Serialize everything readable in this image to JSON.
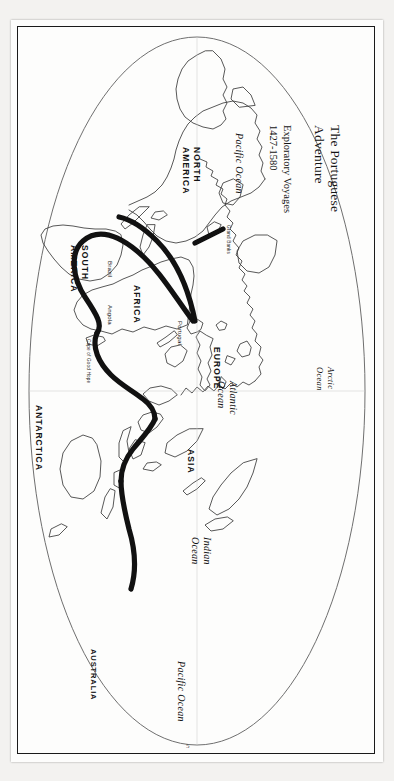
{
  "document": {
    "title_line1": "The Portuguese",
    "title_line2": "Adventure",
    "subtitle_line1": "Exploratory Voyages",
    "subtitle_line2": "1427-1580",
    "page_mark": "5",
    "frame_color": "#1a1a1a",
    "route_color": "#111111",
    "coastline_color": "#3a3a3a",
    "paper_color": "#fdfdfc"
  },
  "map": {
    "projection_note": "oval world map, rotated 90 degrees on the page",
    "continents": [
      {
        "id": "north-america",
        "label": "NORTH\nAMERICA"
      },
      {
        "id": "south-america",
        "label": "SOUTH\nAMERICA"
      },
      {
        "id": "africa",
        "label": "AFRICA"
      },
      {
        "id": "europe",
        "label": "EUROPE"
      },
      {
        "id": "asia",
        "label": "ASIA"
      },
      {
        "id": "australia",
        "label": "AUSTRALIA"
      },
      {
        "id": "antarctica",
        "label": "ANTARCTICA"
      }
    ],
    "continent_labels": {
      "north_america_1": "NORTH",
      "north_america_2": "AMERICA",
      "south_america_1": "SOUTH",
      "south_america_2": "AMERICA",
      "africa": "AFRICA",
      "europe": "EUROPE",
      "asia": "ASIA",
      "australia": "AUSTRALIA",
      "antarctica": "ANTARCTICA"
    },
    "oceans": {
      "pacific_top": "Pacific Ocean",
      "pacific_bottom": "Pacific Ocean",
      "atlantic_1": "Atlantic",
      "atlantic_2": "Ocean",
      "indian_1": "Indian",
      "indian_2": "Ocean",
      "arctic_1": "Arctic",
      "arctic_2": "Ocean"
    },
    "places": {
      "portugal": "Portugal",
      "brazil": "Brazil",
      "angola": "Angola",
      "grand_banks": "Grand Banks",
      "cape_of_good_hope": "Cape of Good Hope"
    }
  }
}
